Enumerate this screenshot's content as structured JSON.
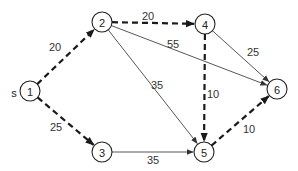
{
  "diagram": {
    "type": "directed-graph",
    "source_label": "s",
    "nodes": [
      {
        "id": "1",
        "label": "1",
        "x": 30,
        "y": 91
      },
      {
        "id": "2",
        "label": "2",
        "x": 102,
        "y": 22
      },
      {
        "id": "3",
        "label": "3",
        "x": 102,
        "y": 152
      },
      {
        "id": "4",
        "label": "4",
        "x": 205,
        "y": 24
      },
      {
        "id": "5",
        "label": "5",
        "x": 204,
        "y": 152
      },
      {
        "id": "6",
        "label": "6",
        "x": 277,
        "y": 89
      }
    ],
    "edges": [
      {
        "from": "1",
        "to": "2",
        "weight": "20",
        "style": "dashed",
        "label_x": 55,
        "label_y": 47
      },
      {
        "from": "1",
        "to": "3",
        "weight": "25",
        "style": "dashed",
        "label_x": 56,
        "label_y": 127
      },
      {
        "from": "2",
        "to": "4",
        "weight": "20",
        "style": "dashed",
        "label_x": 148,
        "label_y": 16
      },
      {
        "from": "2",
        "to": "6",
        "weight": "55",
        "style": "solid",
        "label_x": 173,
        "label_y": 44
      },
      {
        "from": "2",
        "to": "5",
        "weight": "35",
        "style": "solid",
        "label_x": 157,
        "label_y": 85
      },
      {
        "from": "3",
        "to": "5",
        "weight": "35",
        "style": "solid",
        "label_x": 153,
        "label_y": 160
      },
      {
        "from": "4",
        "to": "6",
        "weight": "25",
        "style": "solid",
        "label_x": 253,
        "label_y": 52
      },
      {
        "from": "4",
        "to": "5",
        "weight": "10",
        "style": "dashed",
        "label_x": 213,
        "label_y": 94
      },
      {
        "from": "5",
        "to": "6",
        "weight": "10",
        "style": "dashed",
        "label_x": 249,
        "label_y": 129
      }
    ]
  }
}
